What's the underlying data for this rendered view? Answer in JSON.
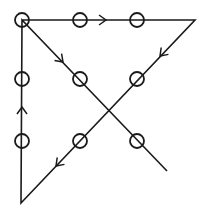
{
  "diagram": {
    "colors": {
      "stroke": "#1a1a1a",
      "background": "#ffffff"
    },
    "dot_radius": 7,
    "dots": [
      {
        "x": 22,
        "y": 20
      },
      {
        "x": 80,
        "y": 20
      },
      {
        "x": 137,
        "y": 20
      },
      {
        "x": 22,
        "y": 79
      },
      {
        "x": 80,
        "y": 79
      },
      {
        "x": 137,
        "y": 79
      },
      {
        "x": 22,
        "y": 141
      },
      {
        "x": 80,
        "y": 141
      },
      {
        "x": 137,
        "y": 141
      }
    ],
    "path": [
      {
        "x": 22,
        "y": 20
      },
      {
        "x": 195,
        "y": 20
      },
      {
        "x": 21,
        "y": 203
      },
      {
        "x": 22,
        "y": 20
      },
      {
        "x": 167,
        "y": 171
      }
    ],
    "arrows": [
      {
        "x": 106,
        "y": 20,
        "angle": 0
      },
      {
        "x": 160,
        "y": 56,
        "angle": 133.6
      },
      {
        "x": 56,
        "y": 166,
        "angle": 133.6
      },
      {
        "x": 22,
        "y": 107,
        "angle": -90
      },
      {
        "x": 63,
        "y": 62,
        "angle": 45
      }
    ]
  }
}
